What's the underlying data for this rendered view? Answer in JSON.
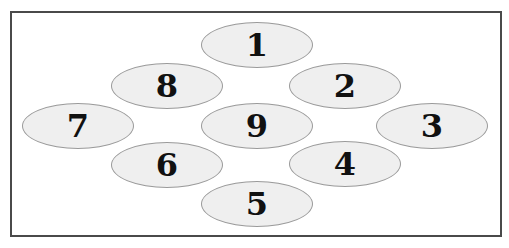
{
  "diagram": {
    "type": "numbered-ellipse-layout",
    "colors": {
      "frame_border": "#4a4a4a",
      "ellipse_fill": "#efefef",
      "ellipse_stroke": "#9a9a9a",
      "text": "#111111"
    },
    "nodes": [
      {
        "label": "1",
        "cx": 257,
        "cy": 45
      },
      {
        "label": "2",
        "cx": 345,
        "cy": 86
      },
      {
        "label": "3",
        "cx": 432,
        "cy": 126
      },
      {
        "label": "4",
        "cx": 345,
        "cy": 164
      },
      {
        "label": "5",
        "cx": 257,
        "cy": 204
      },
      {
        "label": "6",
        "cx": 167,
        "cy": 165
      },
      {
        "label": "7",
        "cx": 78,
        "cy": 126
      },
      {
        "label": "8",
        "cx": 167,
        "cy": 86
      },
      {
        "label": "9",
        "cx": 257,
        "cy": 126
      }
    ]
  }
}
